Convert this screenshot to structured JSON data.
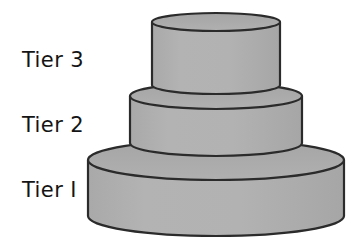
{
  "diagram": {
    "type": "tiered-cake-illustration",
    "background_color": "#ffffff",
    "labels": [
      {
        "id": "tier-3",
        "text": "Tier 3"
      },
      {
        "id": "tier-2",
        "text": "Tier 2"
      },
      {
        "id": "tier-1",
        "text": "Tier I"
      }
    ],
    "colors": {
      "body_fill": "#b0b0b0",
      "top_fill": "#a8a8a8",
      "outline": "#2b2b2b",
      "label_color": "#141414"
    },
    "tiers": [
      {
        "id": "tier-3",
        "name": "Tier 3 cake layer",
        "center_x": 216,
        "top_y": 16,
        "bottom_y": 92,
        "radius_x": 64,
        "radius_y": 9
      },
      {
        "id": "tier-2",
        "name": "Tier 2 cake layer",
        "center_x": 216,
        "top_y": 96,
        "bottom_y": 156,
        "radius_x": 86,
        "radius_y": 13
      },
      {
        "id": "tier-1",
        "name": "Tier 1 cake layer",
        "center_x": 216,
        "top_y": 160,
        "bottom_y": 236,
        "radius_x": 128,
        "radius_y": 20
      }
    ]
  }
}
